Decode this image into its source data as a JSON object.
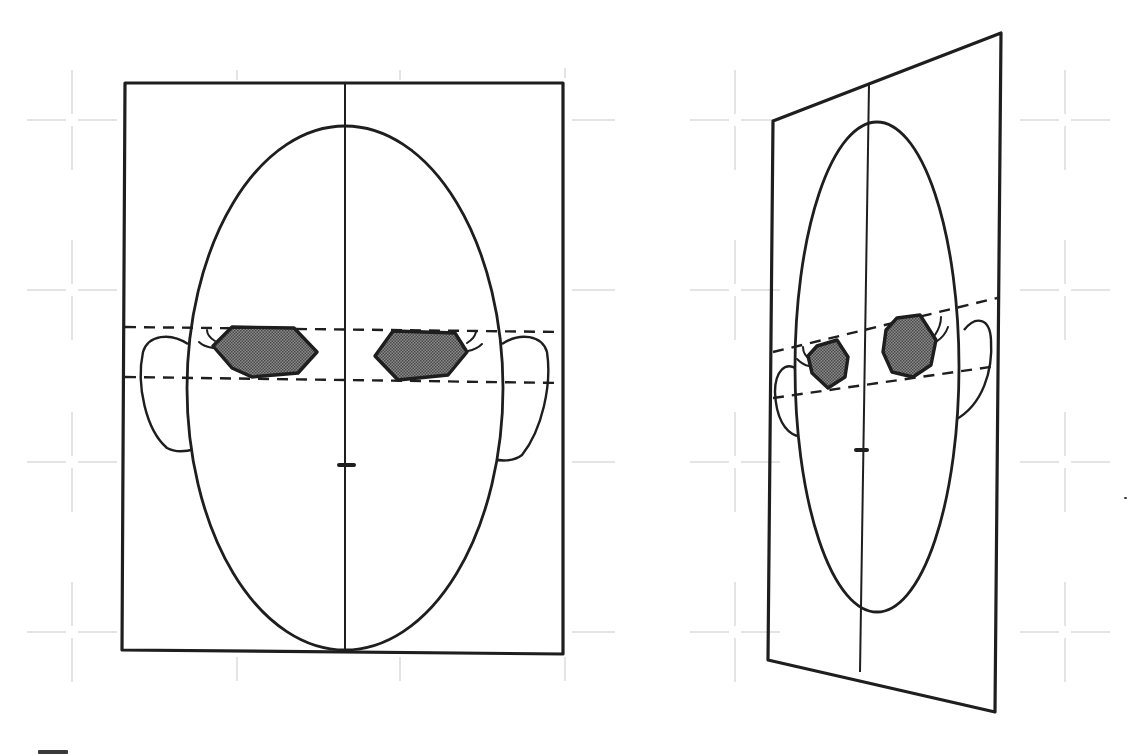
{
  "diagram": {
    "type": "head-construction-comparison",
    "background": "#ffffff",
    "colors": {
      "ink": "#1e1e1e",
      "grid": "#c9c9c9",
      "eye_fill": "#7d7d7d",
      "eye_dot": "#4a4a4a"
    },
    "grid": {
      "crosses": [
        {
          "x": 72,
          "y": 120
        },
        {
          "x": 72,
          "y": 290
        },
        {
          "x": 72,
          "y": 462
        },
        {
          "x": 72,
          "y": 632
        },
        {
          "x": 735,
          "y": 120
        },
        {
          "x": 735,
          "y": 290
        },
        {
          "x": 735,
          "y": 462
        },
        {
          "x": 735,
          "y": 632
        },
        {
          "x": 1065,
          "y": 120
        },
        {
          "x": 1065,
          "y": 290
        },
        {
          "x": 1065,
          "y": 462
        },
        {
          "x": 1065,
          "y": 632
        }
      ],
      "stubs": [
        {
          "x1": 237,
          "y1": 70,
          "x2": 237,
          "y2": 80
        },
        {
          "x1": 400,
          "y1": 70,
          "x2": 400,
          "y2": 80
        },
        {
          "x1": 565,
          "y1": 68,
          "x2": 565,
          "y2": 78
        },
        {
          "x1": 237,
          "y1": 657,
          "x2": 237,
          "y2": 681
        },
        {
          "x1": 400,
          "y1": 657,
          "x2": 400,
          "y2": 681
        },
        {
          "x1": 565,
          "y1": 657,
          "x2": 565,
          "y2": 681
        },
        {
          "x1": 572,
          "y1": 120,
          "x2": 615,
          "y2": 120
        },
        {
          "x1": 572,
          "y1": 290,
          "x2": 615,
          "y2": 290
        },
        {
          "x1": 572,
          "y1": 462,
          "x2": 615,
          "y2": 462
        },
        {
          "x1": 572,
          "y1": 632,
          "x2": 615,
          "y2": 632
        }
      ]
    },
    "panels": [
      {
        "name": "front-view",
        "frame_points": "125,83 563,83 563,654 122,650",
        "centerline": {
          "x1": 345,
          "y1": 83,
          "x2": 345,
          "y2": 652
        },
        "head": {
          "cx": 345,
          "cy": 388,
          "rx": 158,
          "ry": 262
        },
        "ears": [
          "M188,344 C170,332 148,335 143,352 C136,385 146,430 167,448 C176,453 188,451 195,449",
          "M502,344 C520,332 542,335 547,352 C552,385 542,430 522,455 C513,462 500,461 494,459"
        ],
        "guides": [
          {
            "x1": 125,
            "y1": 327,
            "x2": 563,
            "y2": 332
          },
          {
            "x1": 125,
            "y1": 377,
            "x2": 563,
            "y2": 383
          }
        ],
        "eyes": [
          {
            "points": "232,327 294,328 317,352 298,373 252,377 232,368 213,346"
          },
          {
            "points": "393,331 455,333 467,352 448,375 398,380 375,356"
          }
        ],
        "lashes": [
          "M215,341 C210,338 207,334 207,330",
          "M213,348 C207,347 202,345 199,342",
          "M467,343 C472,340 475,336 476,332",
          "M468,351 C474,350 478,348 482,344"
        ],
        "nose": {
          "x1": 339,
          "y1": 465,
          "x2": 354,
          "y2": 465
        }
      },
      {
        "name": "perspective-view",
        "frame_points": "773,121 1001,33 995,712 768,660",
        "centerline": {
          "x1": 869,
          "y1": 84,
          "x2": 860,
          "y2": 672
        },
        "head": {
          "cx": 877,
          "cy": 367,
          "rx": 82,
          "ry": 245
        },
        "ears": [
          "M798,370 C785,360 775,372 775,392 C776,418 785,432 797,436",
          "M964,330 C976,315 990,318 991,340 C993,370 983,405 955,420"
        ],
        "guides": [
          {
            "x1": 773,
            "y1": 352,
            "x2": 997,
            "y2": 298
          },
          {
            "x1": 773,
            "y1": 398,
            "x2": 997,
            "y2": 366
          }
        ],
        "eyes": [
          {
            "points": "817,346 837,340 848,357 845,377 828,388 812,373 808,356"
          },
          {
            "points": "897,318 920,315 936,340 931,365 913,377 892,372 883,352 886,330"
          }
        ],
        "lashes": [
          "M811,360 C806,357 803,352 803,347",
          "M809,366 C803,365 800,362 797,359",
          "M935,335 C939,329 941,322 941,317",
          "M936,342 C942,338 946,333 948,327"
        ],
        "nose": {
          "x1": 856,
          "y1": 450,
          "x2": 867,
          "y2": 450
        }
      }
    ],
    "specks": [
      {
        "x": 1124,
        "y": 497,
        "w": 3,
        "h": 2
      },
      {
        "x": 38,
        "y": 750,
        "w": 30,
        "h": 4
      }
    ]
  }
}
